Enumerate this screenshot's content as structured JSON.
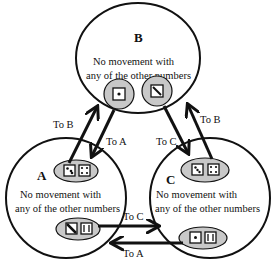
{
  "diagram": {
    "states": [
      {
        "id": "B",
        "label": "B",
        "description_line1": "No movement with",
        "description_line2": "any of the other numbers",
        "dice": [
          "1",
          "2"
        ]
      },
      {
        "id": "A",
        "label": "A",
        "description_line1": "No movement with",
        "description_line2": "any of the other numbers",
        "dice_top": [
          "3",
          "4"
        ],
        "dice_bottom": [
          "2",
          "6"
        ]
      },
      {
        "id": "C",
        "label": "C",
        "description_line1": "No movement with",
        "description_line2": "any of the other numbers",
        "dice_top": [
          "3",
          "4"
        ],
        "dice_bottom": [
          "1",
          "6"
        ]
      }
    ],
    "arrows": [
      {
        "from": "A",
        "to": "B",
        "label": "To B"
      },
      {
        "from": "B",
        "to": "A",
        "label": "To A"
      },
      {
        "from": "B",
        "to": "C",
        "label": "To C"
      },
      {
        "from": "C",
        "to": "B",
        "label": "To B"
      },
      {
        "from": "A",
        "to": "C",
        "label": "To C"
      },
      {
        "from": "C",
        "to": "A",
        "label": "To A"
      }
    ],
    "colors": {
      "oval_fill": "#c8c8c8",
      "line": "#111111",
      "background": "#ffffff"
    }
  }
}
